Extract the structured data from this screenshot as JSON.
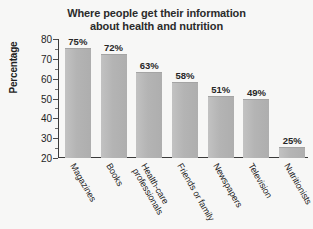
{
  "chart_data": {
    "type": "bar",
    "title": "Where people get their information about health and nutrition",
    "title_lines": [
      "Where people get their information",
      "about health and nutrition"
    ],
    "xlabel": "",
    "ylabel": "Percentage",
    "ylim": [
      20,
      80
    ],
    "ytick_step": 10,
    "yticks": [
      20,
      30,
      40,
      50,
      60,
      70,
      80
    ],
    "ytick_labels": [
      "20",
      "30",
      "40",
      "50",
      "60",
      "70",
      "80"
    ],
    "minor_tick_step": 5,
    "grid": false,
    "legend": false,
    "bar_color": "#b4b4b4",
    "categories": [
      "Magazines",
      "Books",
      "Health-care professionals",
      "Friends or family",
      "Newspapers",
      "Television",
      "Nutritionists"
    ],
    "category_lines": [
      [
        "Magazines"
      ],
      [
        "Books"
      ],
      [
        "Health-care",
        "professionals"
      ],
      [
        "Friends or family"
      ],
      [
        "Newspapers"
      ],
      [
        "Television"
      ],
      [
        "Nutritionists"
      ]
    ],
    "values": [
      75,
      72,
      63,
      58,
      51,
      49,
      25
    ],
    "value_labels": [
      "75%",
      "72%",
      "63%",
      "58%",
      "51%",
      "49%",
      "25%"
    ]
  },
  "colors": {
    "background": "#f7f7f6",
    "axis": "#3a3a3a",
    "text": "#1f1f1f",
    "bar": "#b4b4b4"
  }
}
